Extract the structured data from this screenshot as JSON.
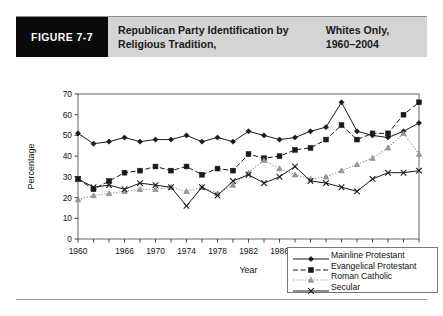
{
  "figure": {
    "tag": "FIGURE 7-7",
    "title_line1": "Republican Party Identification by Religious Tradition,",
    "title_line2": "Whites Only, 1960–2004",
    "tag_bg": "#0a0a0a",
    "banner_bg": "#d4d4d4"
  },
  "chart_data": {
    "type": "line",
    "title": "Republican Party Identification by Religious Tradition, Whites Only, 1960–2004",
    "xlabel": "Year",
    "ylabel": "Percentage",
    "ylim": [
      0,
      70
    ],
    "yticks": [
      0,
      10,
      20,
      30,
      40,
      50,
      60,
      70
    ],
    "xlim": [
      1960,
      2004
    ],
    "xticks": [
      1960,
      1962,
      1964,
      1966,
      1968,
      1970,
      1972,
      1974,
      1976,
      1978,
      1980,
      1982,
      1984,
      1986,
      1988,
      1990,
      1992,
      1994,
      1996,
      1998,
      2000,
      2002,
      2004
    ],
    "xtick_labels": [
      "1960",
      "1966",
      "1970",
      "1974",
      "1978",
      "1982",
      "1986",
      "1990",
      "1994",
      "1998",
      "2002",
      "2004"
    ],
    "xtick_label_values": [
      1960,
      1966,
      1970,
      1974,
      1978,
      1982,
      1986,
      1990,
      1994,
      1998,
      2002,
      2004
    ],
    "grid": false,
    "legend_position": "inside-bottom-right",
    "x": [
      1960,
      1962,
      1964,
      1966,
      1968,
      1970,
      1972,
      1974,
      1976,
      1978,
      1980,
      1982,
      1984,
      1986,
      1988,
      1990,
      1992,
      1994,
      1996,
      1998,
      2000,
      2002,
      2004
    ],
    "series": [
      {
        "name": "Mainline Protestant",
        "marker": "diamond",
        "line": "solid",
        "values": [
          51,
          46,
          47,
          49,
          47,
          48,
          48,
          50,
          47,
          49,
          47,
          52,
          50,
          48,
          49,
          52,
          54,
          66,
          52,
          50,
          49,
          52,
          56
        ]
      },
      {
        "name": "Evangelical Protestant",
        "marker": "square",
        "line": "dashed",
        "values": [
          29,
          24,
          28,
          32,
          33,
          35,
          33,
          35,
          31,
          34,
          33,
          41,
          39,
          40,
          43,
          44,
          48,
          55,
          48,
          51,
          51,
          60,
          66
        ]
      },
      {
        "name": "Roman Catholic",
        "marker": "triangle",
        "line": "dotted",
        "values": [
          19,
          21,
          22,
          23,
          24,
          24,
          25,
          23,
          25,
          22,
          26,
          32,
          38,
          34,
          31,
          29,
          30,
          33,
          36,
          39,
          44,
          51,
          41
        ]
      },
      {
        "name": "Secular",
        "marker": "cross",
        "line": "solid",
        "values": [
          29,
          25,
          26,
          24,
          27,
          26,
          25,
          16,
          25,
          21,
          28,
          31,
          27,
          30,
          35,
          28,
          27,
          25,
          23,
          29,
          32,
          32,
          33
        ]
      }
    ]
  }
}
